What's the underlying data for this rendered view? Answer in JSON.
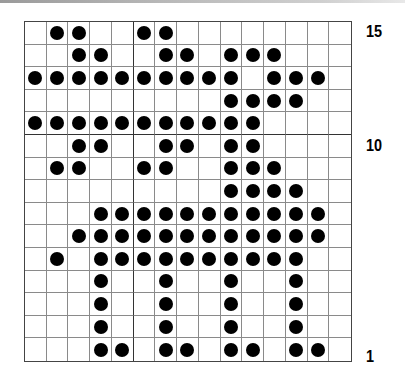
{
  "chart": {
    "columns": 15,
    "rows": 15,
    "row_numbering": "bottom-to-top",
    "thick_vertical_after_column": 5,
    "thick_horizontal_between_rows": [
      11,
      10
    ],
    "colors": {
      "dot": "#000000",
      "grid_line": "#8a8a8a",
      "thick_line": "#333333",
      "background": "#ffffff"
    },
    "row_labels": [
      {
        "row": 15,
        "text": "15"
      },
      {
        "row": 10,
        "text": "10"
      },
      {
        "row": 1,
        "text": "1"
      }
    ],
    "filled_cells_by_row": {
      "15": [
        2,
        3,
        6,
        7
      ],
      "14": [
        3,
        4,
        7,
        8,
        10,
        11,
        12
      ],
      "13": [
        1,
        2,
        3,
        4,
        5,
        6,
        7,
        8,
        9,
        10,
        12,
        13,
        14
      ],
      "12": [
        10,
        11,
        12,
        13
      ],
      "11": [
        1,
        2,
        3,
        4,
        5,
        6,
        7,
        8,
        9,
        10,
        11
      ],
      "10": [
        3,
        4,
        7,
        8,
        10,
        11
      ],
      "9": [
        2,
        3,
        6,
        7,
        10,
        11,
        12
      ],
      "8": [
        10,
        11,
        12,
        13
      ],
      "7": [
        4,
        5,
        6,
        7,
        8,
        9,
        10,
        11,
        12,
        13,
        14
      ],
      "6": [
        3,
        4,
        5,
        6,
        7,
        8,
        9,
        10,
        11,
        12,
        13,
        14
      ],
      "5": [
        2,
        4,
        5,
        6,
        7,
        8,
        9,
        10,
        11,
        12,
        13
      ],
      "4": [
        4,
        7,
        10,
        13
      ],
      "3": [
        4,
        7,
        10,
        13
      ],
      "2": [
        4,
        7,
        10,
        13
      ],
      "1": [
        4,
        5,
        7,
        8,
        10,
        11,
        13,
        14
      ]
    }
  }
}
